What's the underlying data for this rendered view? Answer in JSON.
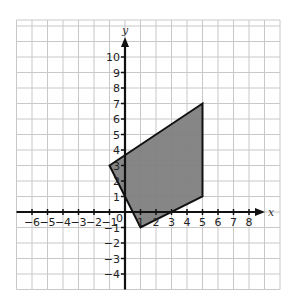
{
  "figure": {
    "axis_labels": {
      "x": "x",
      "y": "y"
    },
    "origin_label": "0",
    "x_range": [
      -7,
      10
    ],
    "y_range": [
      -5,
      12
    ],
    "x_ticks": [
      -6,
      -5,
      -4,
      -3,
      -2,
      -1,
      1,
      2,
      3,
      4,
      5,
      6,
      7,
      8
    ],
    "y_ticks": [
      -4,
      -3,
      -2,
      -1,
      1,
      2,
      3,
      4,
      5,
      6,
      7,
      8,
      9,
      10
    ],
    "polygon": {
      "vertices": [
        [
          -1,
          3
        ],
        [
          5,
          7
        ],
        [
          5,
          1
        ],
        [
          1,
          -1
        ]
      ],
      "fill": "#808080",
      "stroke": "#111111"
    },
    "colors": {
      "grid": "#c8c8c8",
      "axis": "#111111"
    }
  }
}
